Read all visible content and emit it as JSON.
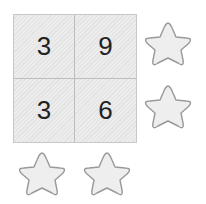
{
  "grid": {
    "cells": [
      "3",
      "9",
      "3",
      "6"
    ]
  },
  "stars": [
    {
      "id": "star-1",
      "x": 143,
      "y": 20
    },
    {
      "id": "star-2",
      "x": 143,
      "y": 83
    },
    {
      "id": "star-3",
      "x": 17,
      "y": 149
    },
    {
      "id": "star-4",
      "x": 82,
      "y": 149
    }
  ],
  "colors": {
    "star_fill": "#eeeeee",
    "star_stroke": "#999999",
    "grid_border": "#c8c8c8"
  }
}
